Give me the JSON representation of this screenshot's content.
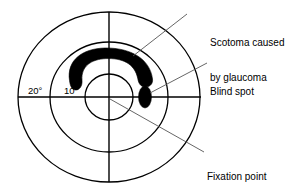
{
  "diagram": {
    "background_color": "#ffffff",
    "line_color": "#000000",
    "fill_color": "#000000",
    "leader_color": "#555555"
  },
  "axes": {
    "center": {
      "x": 109,
      "y": 97
    },
    "horizontal_meridian": {
      "x1": 18,
      "y1": 97,
      "x2": 201,
      "y2": 97
    },
    "vertical_meridian": {
      "x1": 109,
      "y1": 12,
      "x2": 109,
      "y2": 182
    }
  },
  "rings": [
    {
      "name": "outer-ring",
      "degrees": 20,
      "rx": 91,
      "ry": 85
    },
    {
      "name": "middle-ring",
      "degrees": 10,
      "rx": 59,
      "ry": 55
    },
    {
      "name": "inner-ring",
      "degrees": 5,
      "rx": 24,
      "ry": 23
    }
  ],
  "ring_labels": {
    "outer": "20°",
    "inner": "10°"
  },
  "features": {
    "scotoma": {
      "name": "scotoma",
      "description": "arc-shaped dense defect superior to fixation",
      "cx": 109,
      "cy": 70,
      "rx": 41,
      "ry": 26
    },
    "blind_spot": {
      "name": "blind-spot",
      "cx": 145,
      "cy": 97,
      "rx": 6.5,
      "ry": 11
    },
    "fixation_point": {
      "name": "fixation-point",
      "cx": 109,
      "cy": 97
    }
  },
  "annotations": [
    {
      "id": "scotoma",
      "lines": [
        "Scotoma caused",
        "by glaucoma"
      ],
      "leader": {
        "x1": 187,
        "y1": 14,
        "x2": 133,
        "y2": 56
      }
    },
    {
      "id": "blind_spot",
      "lines": [
        "Blind spot"
      ],
      "leader": {
        "x1": 207,
        "y1": 63,
        "x2": 150,
        "y2": 93
      }
    },
    {
      "id": "fixation_point",
      "lines": [
        "Fixation point"
      ],
      "leader": {
        "x1": 204,
        "y1": 152,
        "x2": 110,
        "y2": 99
      }
    }
  ]
}
